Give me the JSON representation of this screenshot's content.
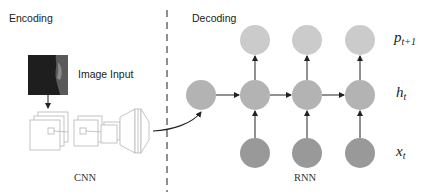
{
  "encoding": {
    "title": "Encoding",
    "image_input_label": "Image Input",
    "cnn_label": "CNN"
  },
  "decoding": {
    "title": "Decoding",
    "rnn_label": "RNN"
  },
  "math_labels": {
    "output": {
      "base": "p",
      "sub": "t+1"
    },
    "hidden": {
      "base": "h",
      "sub": "t"
    },
    "input": {
      "base": "x",
      "sub": "t"
    }
  },
  "colors": {
    "output_node": "#cbcbcb",
    "hidden_node": "#b3b3b3",
    "input_node": "#999999",
    "arrow": "#222222",
    "divider": "#444444",
    "cnn_outline": "#bdbdbd"
  },
  "nodes": {
    "output_row_y": 40,
    "hidden_row_y": 95,
    "input_row_y": 153,
    "radius": 15,
    "hidden_x": [
      201,
      255,
      307,
      360
    ],
    "output_x": [
      255,
      307,
      360
    ],
    "input_x": [
      255,
      307,
      360
    ]
  }
}
